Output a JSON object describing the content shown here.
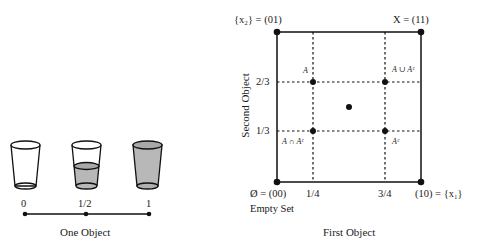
{
  "left_panel": {
    "caption": "One Object",
    "glasses": [
      {
        "fill": 0,
        "label": "0"
      },
      {
        "fill": 0.5,
        "label": "1/2"
      },
      {
        "fill": 1,
        "label": "1"
      }
    ]
  },
  "right_panel": {
    "x_axis_title": "First Object",
    "y_axis_title": "Second Object",
    "corners": {
      "top_left": "{x₂} = (01)",
      "top_right": "X = (11)",
      "bottom_left": "Ø = (00)",
      "bottom_left_sub": "Empty Set",
      "bottom_right": "(10) = {x₁}"
    },
    "x_ticks": [
      "1/4",
      "3/4"
    ],
    "y_ticks": [
      "2/3",
      "1/3"
    ],
    "point_labels": {
      "A": "A",
      "A_union_Ac": "A ∪ Aᶜ",
      "A_inter_Ac": "A ∩ Aᶜ",
      "Ac": "Aᶜ"
    }
  },
  "colors": {
    "line": "#111111",
    "glass_fill": "#b8b8b8"
  }
}
